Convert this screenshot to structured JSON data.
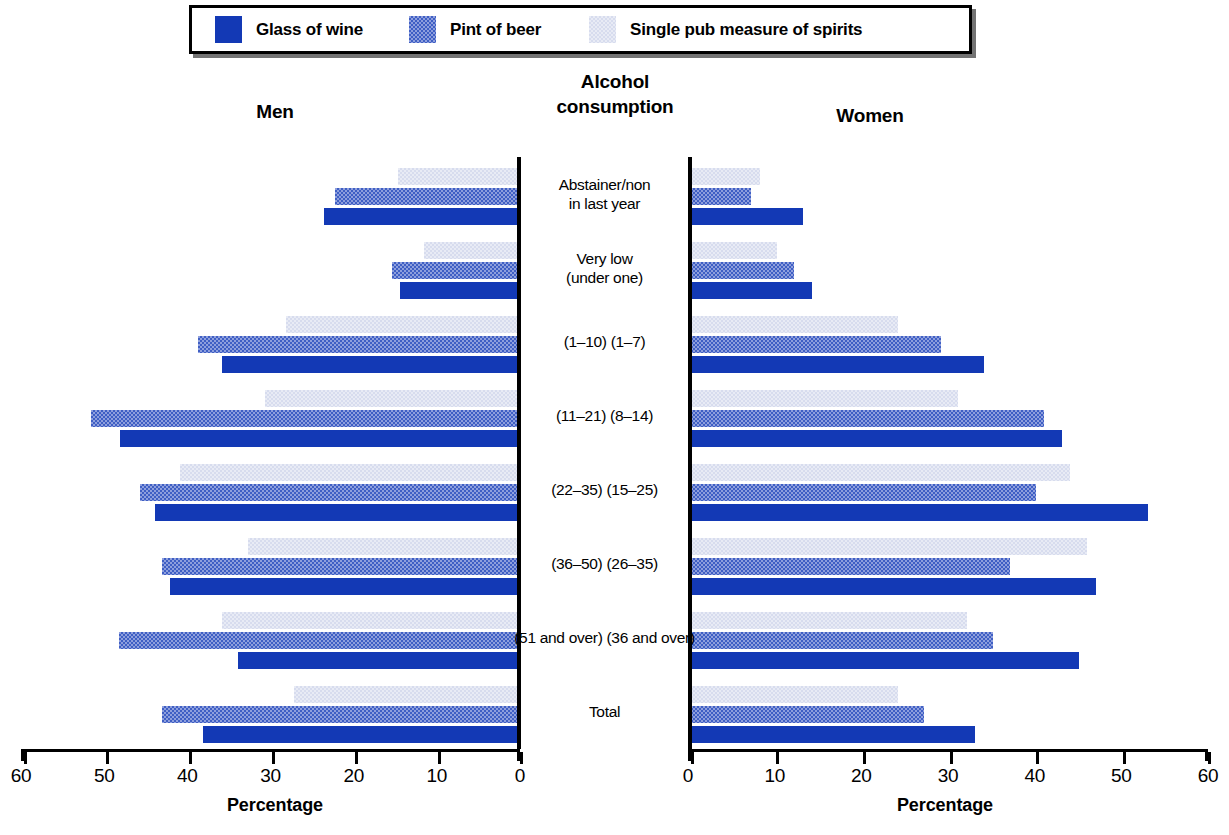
{
  "legend": {
    "items": [
      {
        "label": "Glass of wine",
        "swatch": "wine-swatch",
        "color": "#1339b5"
      },
      {
        "label": "Pint of beer",
        "swatch": "beer-swatch",
        "color": "#8e9fdd"
      },
      {
        "label": "Single pub measure of spirits",
        "swatch": "spirits-swatch",
        "color": "#e8ebf5"
      }
    ]
  },
  "headings": {
    "left": "Men",
    "center": "Alcohol\nconsumption",
    "center_line1": "Alcohol",
    "center_line2": "consumption",
    "right": "Women"
  },
  "axes": {
    "left_title": "Percentage",
    "right_title": "Percentage",
    "left_ticks": [
      "60",
      "50",
      "40",
      "30",
      "20",
      "10",
      "0"
    ],
    "right_ticks": [
      "0",
      "10",
      "20",
      "30",
      "40",
      "50",
      "60"
    ]
  },
  "categories": [
    {
      "line1": "Abstainer/non",
      "line2": "in last year"
    },
    {
      "line1": "Very low",
      "line2": "(under one)"
    },
    {
      "line1": "(1–10) (1–7)",
      "line2": ""
    },
    {
      "line1": "(11–21) (8–14)",
      "line2": ""
    },
    {
      "line1": "(22–35) (15–25)",
      "line2": ""
    },
    {
      "line1": "(36–50) (26–35)",
      "line2": ""
    },
    {
      "line1": "(51 and over) (36 and over)",
      "line2": ""
    },
    {
      "line1": "Total",
      "line2": ""
    }
  ],
  "chart_data": {
    "type": "bar",
    "orientation": "horizontal",
    "layout": "back-to-back population pyramid",
    "title": "Alcohol consumption",
    "xlabel": "Percentage",
    "ylabel": "Alcohol consumption",
    "xlim": [
      0,
      60
    ],
    "grid": false,
    "legend_position": "top",
    "categories": [
      "Abstainer/non in last year",
      "Very low (under one)",
      "(1-10) (1-7)",
      "(11-21) (8-14)",
      "(22-35) (15-25)",
      "(36-50) (26-35)",
      "(51 and over) (36 and over)",
      "Total"
    ],
    "panels": [
      {
        "name": "Men",
        "side": "left",
        "axis_direction": "reversed",
        "axis_ticks": [
          60,
          50,
          40,
          30,
          20,
          10,
          0
        ],
        "series": [
          {
            "name": "Single pub measure of spirits",
            "values": [
              14.4,
              11.2,
              28.0,
              30.5,
              40.8,
              32.5,
              35.7,
              27.0
            ]
          },
          {
            "name": "Pint of beer",
            "values": [
              22.0,
              15.1,
              38.6,
              51.5,
              45.6,
              43.0,
              48.2,
              43.0
            ]
          },
          {
            "name": "Glass of wine",
            "values": [
              23.3,
              14.1,
              35.7,
              48.0,
              43.8,
              42.0,
              33.8,
              38.0
            ]
          }
        ]
      },
      {
        "name": "Women",
        "side": "right",
        "axis_direction": "normal",
        "axis_ticks": [
          0,
          10,
          20,
          30,
          40,
          50,
          60
        ],
        "series": [
          {
            "name": "Single pub measure of spirits",
            "values": [
              8.0,
              10.0,
              24.0,
              31.0,
              44.0,
              46.0,
              32.0,
              24.0
            ]
          },
          {
            "name": "Pint of beer",
            "values": [
              7.0,
              12.0,
              29.0,
              41.0,
              40.0,
              37.0,
              35.0,
              27.0
            ]
          },
          {
            "name": "Glass of wine",
            "values": [
              13.0,
              14.0,
              34.0,
              43.0,
              53.0,
              47.0,
              45.0,
              33.0
            ]
          }
        ]
      }
    ]
  }
}
